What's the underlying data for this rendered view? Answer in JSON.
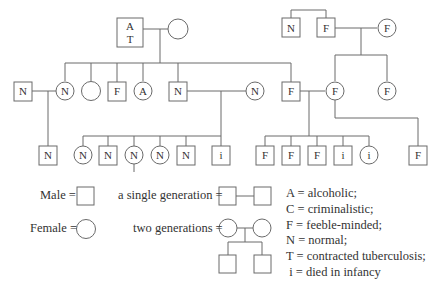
{
  "pedigree": {
    "generation1": {
      "left_couple": {
        "male": {
          "label_top": "A",
          "label_bottom": "T"
        },
        "female": {
          "label": ""
        }
      },
      "right_siblings": [
        {
          "sex": "male",
          "label": "N"
        },
        {
          "sex": "male",
          "label": "F"
        }
      ],
      "right_spouse": {
        "sex": "female",
        "label": "F"
      }
    },
    "generation2": [
      {
        "sex": "male",
        "label": "N",
        "role": "spouse"
      },
      {
        "sex": "female",
        "label": "N"
      },
      {
        "sex": "female",
        "label": ""
      },
      {
        "sex": "male",
        "label": "F"
      },
      {
        "sex": "female",
        "label": "A"
      },
      {
        "sex": "male",
        "label": "N"
      },
      {
        "sex": "female",
        "label": "N",
        "role": "spouse"
      },
      {
        "sex": "male",
        "label": "F"
      },
      {
        "sex": "female",
        "label": "F"
      },
      {
        "sex": "female",
        "label": "F"
      }
    ],
    "generation3": [
      {
        "sex": "male",
        "label": "N"
      },
      {
        "sex": "female",
        "label": "N"
      },
      {
        "sex": "male",
        "label": "N"
      },
      {
        "sex": "female",
        "label": "N"
      },
      {
        "sex": "female",
        "label": "N"
      },
      {
        "sex": "male",
        "label": "N"
      },
      {
        "sex": "male",
        "label": "i"
      },
      {
        "sex": "male",
        "label": "F"
      },
      {
        "sex": "male",
        "label": "F"
      },
      {
        "sex": "male",
        "label": "F"
      },
      {
        "sex": "male",
        "label": "i"
      },
      {
        "sex": "female",
        "label": "i"
      },
      {
        "sex": "male",
        "label": "F"
      }
    ]
  },
  "legend": {
    "male": "Male =",
    "female": "Female =",
    "single_generation": "a single generation =",
    "two_generations": "two generations ="
  },
  "key": [
    "A = alcoholic;",
    "C = criminalistic;",
    "F = feeble-minded;",
    "N = normal;",
    "T = contracted tuberculosis;",
    " i = died in infancy"
  ]
}
